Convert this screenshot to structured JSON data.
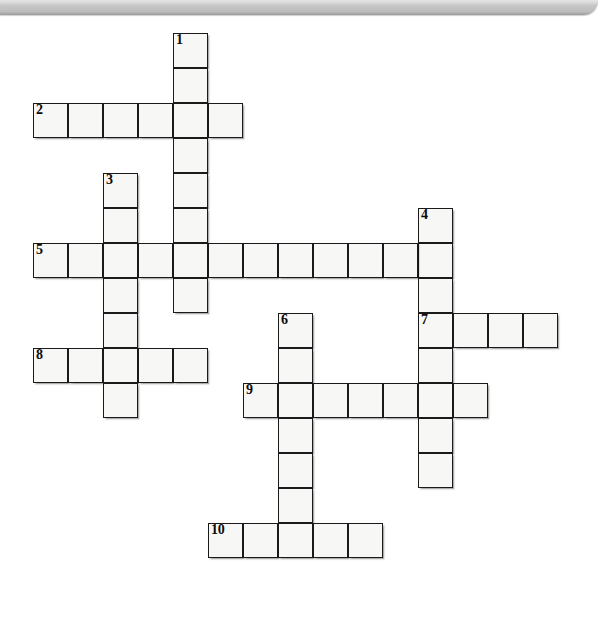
{
  "document": {
    "type": "crossword-puzzle",
    "title": "",
    "background_color": "#ffffff",
    "cell_fill_color": "#f7f7f5",
    "cell_border_color": "#1a1a1a"
  },
  "top_bar": {
    "name": "window-chrome-bar",
    "color": "#c4c4c4",
    "height_px": 15
  },
  "grid": {
    "cell_size_px": 35,
    "origin_x_px": 33,
    "origin_y_px": 33,
    "columns": 16,
    "rows": 17
  },
  "clue_numbers": [
    "1",
    "2",
    "3",
    "4",
    "5",
    "6",
    "7",
    "8",
    "9",
    "10"
  ],
  "entries": [
    {
      "number": "1",
      "direction": "down",
      "start_col": 4,
      "start_row": 0,
      "length": 9
    },
    {
      "number": "2",
      "direction": "across",
      "start_col": 0,
      "start_row": 2,
      "length": 6
    },
    {
      "number": "3",
      "direction": "down",
      "start_col": 2,
      "start_row": 4,
      "length": 7
    },
    {
      "number": "4",
      "direction": "down",
      "start_col": 11,
      "start_row": 5,
      "length": 9
    },
    {
      "number": "5",
      "direction": "across",
      "start_col": 0,
      "start_row": 6,
      "length": 12
    },
    {
      "number": "6",
      "direction": "down",
      "start_col": 7,
      "start_row": 8,
      "length": 7
    },
    {
      "number": "7",
      "direction": "across",
      "start_col": 11,
      "start_row": 8,
      "length": 4
    },
    {
      "number": "8",
      "direction": "across",
      "start_col": 0,
      "start_row": 9,
      "length": 5
    },
    {
      "number": "9",
      "direction": "across",
      "start_col": 6,
      "start_row": 10,
      "length": 7
    },
    {
      "number": "10",
      "direction": "across",
      "start_col": 5,
      "start_row": 14,
      "length": 5
    }
  ],
  "cells": [
    {
      "col": 4,
      "row": 0,
      "number": "1"
    },
    {
      "col": 4,
      "row": 1,
      "number": ""
    },
    {
      "col": 0,
      "row": 2,
      "number": "2"
    },
    {
      "col": 1,
      "row": 2,
      "number": ""
    },
    {
      "col": 2,
      "row": 2,
      "number": ""
    },
    {
      "col": 3,
      "row": 2,
      "number": ""
    },
    {
      "col": 4,
      "row": 2,
      "number": ""
    },
    {
      "col": 5,
      "row": 2,
      "number": ""
    },
    {
      "col": 4,
      "row": 3,
      "number": ""
    },
    {
      "col": 4,
      "row": 4,
      "number": ""
    },
    {
      "col": 2,
      "row": 4,
      "number": "3"
    },
    {
      "col": 2,
      "row": 5,
      "number": ""
    },
    {
      "col": 4,
      "row": 5,
      "number": ""
    },
    {
      "col": 11,
      "row": 5,
      "number": "4"
    },
    {
      "col": 11,
      "row": 6,
      "number": ""
    },
    {
      "col": 0,
      "row": 6,
      "number": "5"
    },
    {
      "col": 1,
      "row": 6,
      "number": ""
    },
    {
      "col": 2,
      "row": 6,
      "number": ""
    },
    {
      "col": 3,
      "row": 6,
      "number": ""
    },
    {
      "col": 4,
      "row": 6,
      "number": ""
    },
    {
      "col": 5,
      "row": 6,
      "number": ""
    },
    {
      "col": 6,
      "row": 6,
      "number": ""
    },
    {
      "col": 7,
      "row": 6,
      "number": ""
    },
    {
      "col": 8,
      "row": 6,
      "number": ""
    },
    {
      "col": 9,
      "row": 6,
      "number": ""
    },
    {
      "col": 10,
      "row": 6,
      "number": ""
    },
    {
      "col": 2,
      "row": 7,
      "number": ""
    },
    {
      "col": 4,
      "row": 7,
      "number": ""
    },
    {
      "col": 11,
      "row": 7,
      "number": ""
    },
    {
      "col": 2,
      "row": 8,
      "number": ""
    },
    {
      "col": 7,
      "row": 8,
      "number": "6"
    },
    {
      "col": 11,
      "row": 8,
      "number": "7"
    },
    {
      "col": 12,
      "row": 8,
      "number": ""
    },
    {
      "col": 13,
      "row": 8,
      "number": ""
    },
    {
      "col": 14,
      "row": 8,
      "number": ""
    },
    {
      "col": 0,
      "row": 9,
      "number": "8"
    },
    {
      "col": 1,
      "row": 9,
      "number": ""
    },
    {
      "col": 2,
      "row": 9,
      "number": ""
    },
    {
      "col": 3,
      "row": 9,
      "number": ""
    },
    {
      "col": 4,
      "row": 9,
      "number": ""
    },
    {
      "col": 7,
      "row": 9,
      "number": ""
    },
    {
      "col": 11,
      "row": 9,
      "number": ""
    },
    {
      "col": 2,
      "row": 10,
      "number": ""
    },
    {
      "col": 6,
      "row": 10,
      "number": "9"
    },
    {
      "col": 7,
      "row": 10,
      "number": ""
    },
    {
      "col": 8,
      "row": 10,
      "number": ""
    },
    {
      "col": 9,
      "row": 10,
      "number": ""
    },
    {
      "col": 10,
      "row": 10,
      "number": ""
    },
    {
      "col": 11,
      "row": 10,
      "number": ""
    },
    {
      "col": 12,
      "row": 10,
      "number": ""
    },
    {
      "col": 7,
      "row": 11,
      "number": ""
    },
    {
      "col": 11,
      "row": 11,
      "number": ""
    },
    {
      "col": 7,
      "row": 12,
      "number": ""
    },
    {
      "col": 11,
      "row": 12,
      "number": ""
    },
    {
      "col": 7,
      "row": 13,
      "number": ""
    },
    {
      "col": 5,
      "row": 14,
      "number": "10"
    },
    {
      "col": 6,
      "row": 14,
      "number": ""
    },
    {
      "col": 7,
      "row": 14,
      "number": ""
    },
    {
      "col": 8,
      "row": 14,
      "number": ""
    },
    {
      "col": 9,
      "row": 14,
      "number": ""
    }
  ]
}
